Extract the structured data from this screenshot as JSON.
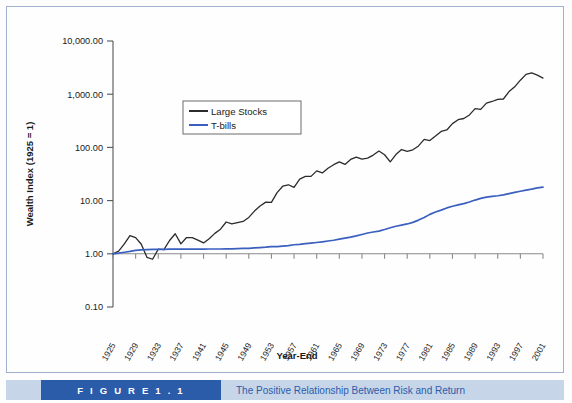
{
  "figure": {
    "tag": "F I G U R E   1 . 1",
    "caption": "The Positive Relationship Between Risk and Return"
  },
  "chart_data": {
    "type": "line",
    "title": "",
    "xlabel": "Year-End",
    "ylabel": "Wealth Index (1925 = 1)",
    "yscale": "log",
    "ylim": [
      0.1,
      10000.0
    ],
    "grid": false,
    "legend_position": "upper-left-inside",
    "ytick_labels": [
      "10,000.00",
      "1,000.00",
      "100.00",
      "10.00",
      "1.00",
      "0.10"
    ],
    "ytick_values": [
      10000,
      1000,
      100,
      10,
      1,
      0.1
    ],
    "xtick_labels": [
      "1925",
      "1929",
      "1933",
      "1937",
      "1941",
      "1945",
      "1949",
      "1953",
      "1957",
      "1961",
      "1965",
      "1969",
      "1973",
      "1977",
      "1981",
      "1985",
      "1989",
      "1993",
      "1997",
      "2001"
    ],
    "x": [
      1925,
      1926,
      1927,
      1928,
      1929,
      1930,
      1931,
      1932,
      1933,
      1934,
      1935,
      1936,
      1937,
      1938,
      1939,
      1940,
      1941,
      1942,
      1943,
      1944,
      1945,
      1946,
      1947,
      1948,
      1949,
      1950,
      1951,
      1952,
      1953,
      1954,
      1955,
      1956,
      1957,
      1958,
      1959,
      1960,
      1961,
      1962,
      1963,
      1964,
      1965,
      1966,
      1967,
      1968,
      1969,
      1970,
      1971,
      1972,
      1973,
      1974,
      1975,
      1976,
      1977,
      1978,
      1979,
      1980,
      1981,
      1982,
      1983,
      1984,
      1985,
      1986,
      1987,
      1988,
      1989,
      1990,
      1991,
      1992,
      1993,
      1994,
      1995,
      1996,
      1997,
      1998,
      1999,
      2000,
      2001
    ],
    "series": [
      {
        "name": "Large Stocks",
        "color": "#2b2b2b",
        "values": [
          1.0,
          1.12,
          1.54,
          2.2,
          2.02,
          1.51,
          0.86,
          0.79,
          1.22,
          1.2,
          1.78,
          2.38,
          1.54,
          2.02,
          2.01,
          1.81,
          1.6,
          1.92,
          2.42,
          2.9,
          3.96,
          3.64,
          3.85,
          4.06,
          4.83,
          6.36,
          7.89,
          9.36,
          9.27,
          14.14,
          18.62,
          19.84,
          17.71,
          25.4,
          28.43,
          28.56,
          36.23,
          33.08,
          40.62,
          47.34,
          53.25,
          47.89,
          59.36,
          65.9,
          60.32,
          62.72,
          71.68,
          85.3,
          72.78,
          53.5,
          73.42,
          90.95,
          84.45,
          89.97,
          106.62,
          141.19,
          134.26,
          163.11,
          199.9,
          212.49,
          279.92,
          332.11,
          349.51,
          407.47,
          536.46,
          519.73,
          677.95,
          729.55,
          802.51,
          813.0,
          1118.3,
          1374.83,
          1833.45,
          2357.35,
          2512.77,
          2284.0,
          2012.0
        ]
      },
      {
        "name": "T-bills",
        "color": "#3a5fbf",
        "values": [
          1.0,
          1.03,
          1.07,
          1.11,
          1.16,
          1.19,
          1.2,
          1.21,
          1.21,
          1.21,
          1.22,
          1.22,
          1.22,
          1.22,
          1.22,
          1.22,
          1.22,
          1.23,
          1.23,
          1.23,
          1.24,
          1.24,
          1.25,
          1.26,
          1.27,
          1.29,
          1.31,
          1.33,
          1.36,
          1.37,
          1.4,
          1.43,
          1.48,
          1.5,
          1.55,
          1.59,
          1.63,
          1.68,
          1.74,
          1.8,
          1.88,
          1.97,
          2.06,
          2.17,
          2.31,
          2.46,
          2.57,
          2.67,
          2.86,
          3.09,
          3.29,
          3.46,
          3.64,
          3.9,
          4.3,
          4.81,
          5.51,
          6.1,
          6.63,
          7.28,
          7.84,
          8.32,
          8.78,
          9.41,
          10.23,
          10.99,
          11.59,
          11.99,
          12.35,
          12.85,
          13.57,
          14.27,
          15.0,
          15.72,
          16.45,
          17.4,
          17.9
        ]
      }
    ]
  },
  "legend": {
    "items": [
      {
        "label": "Large Stocks",
        "color": "#2b2b2b"
      },
      {
        "label": "T-bills",
        "color": "#3a5fbf"
      }
    ]
  }
}
